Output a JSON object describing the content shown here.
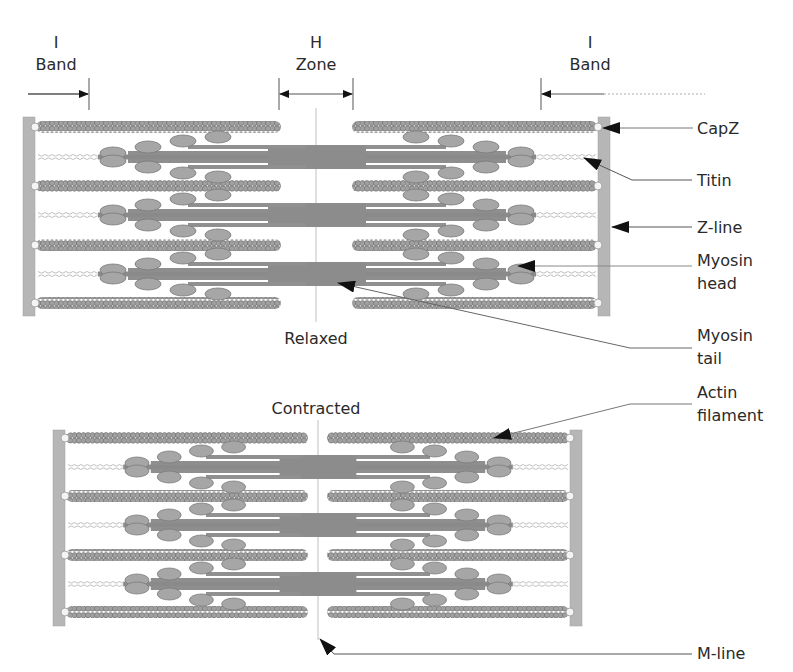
{
  "colors": {
    "background": "#ffffff",
    "zline": "#b4b4b4",
    "actin": "#9a9a9a",
    "actin_dark": "#7a7a7a",
    "myosin": "#8c8c8c",
    "myosin_head": "#a8a8a8",
    "titin": "#b8b8b8",
    "leader": "#555555",
    "arrow": "#111111",
    "text": "#2a2a2a"
  },
  "band_labels": {
    "i_band_left": {
      "line1": "I",
      "line2": "Band"
    },
    "h_zone": {
      "line1": "H",
      "line2": "Zone"
    },
    "i_band_right": {
      "line1": "I",
      "line2": "Band"
    }
  },
  "states": {
    "relaxed": {
      "label": "Relaxed"
    },
    "contracted": {
      "label": "Contracted"
    }
  },
  "callouts": [
    {
      "id": "capz",
      "line1": "CapZ",
      "line2": ""
    },
    {
      "id": "titin",
      "line1": "Titin",
      "line2": ""
    },
    {
      "id": "zline",
      "line1": "Z-line",
      "line2": ""
    },
    {
      "id": "myosin-head",
      "line1": "Myosin",
      "line2": "head"
    },
    {
      "id": "myosin-tail",
      "line1": "Myosin",
      "line2": "tail"
    },
    {
      "id": "actin-filament",
      "line1": "Actin",
      "line2": "filament"
    },
    {
      "id": "mline",
      "line1": "M-line",
      "line2": ""
    }
  ]
}
